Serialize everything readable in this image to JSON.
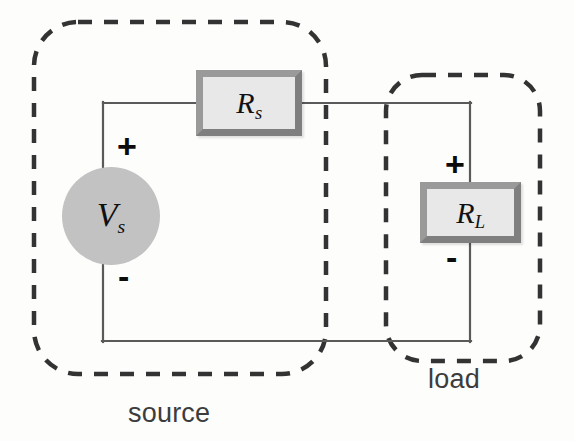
{
  "diagram": {
    "background_color": "#fdfdfc"
  },
  "regions": [
    {
      "id": "source",
      "label": "source",
      "label_x": 128,
      "label_y": 398,
      "boundary_style": "dashed-rounded-rect",
      "x": 34,
      "y": 22,
      "width": 292,
      "height": 352
    },
    {
      "id": "load",
      "label": "load",
      "label_x": 428,
      "label_y": 364,
      "boundary_style": "dashed-rounded-rect",
      "x": 386,
      "y": 75,
      "width": 154,
      "height": 286
    }
  ],
  "components": {
    "source": {
      "name": "voltage-source",
      "symbol": "V",
      "subscript": "s",
      "shape": "filled-circle",
      "fill_color": "#c2c2c2",
      "cx": 111,
      "cy": 216,
      "r": 49,
      "plus_label": "+",
      "minus_label": "-"
    },
    "rs": {
      "name": "series-resistor",
      "symbol": "R",
      "subscript": "s",
      "shape": "rectangle",
      "fill_color": "#e8e8e8",
      "border_color": "#8a8a8a",
      "orientation": "horizontal",
      "x": 196,
      "y": 70,
      "width": 106,
      "height": 66
    },
    "rl": {
      "name": "load-resistor",
      "symbol": "R",
      "subscript": "L",
      "shape": "rectangle",
      "fill_color": "#e8e8e8",
      "border_color": "#8a8a8a",
      "orientation": "vertical",
      "x": 420,
      "y": 182,
      "width": 101,
      "height": 61,
      "plus_label": "+",
      "minus_label": "-"
    }
  },
  "wires": {
    "color": "#5a5a5a",
    "width": 2,
    "segments": [
      {
        "name": "top-left-wire",
        "x1": 103,
        "y1": 103,
        "x2": 196,
        "y2": 103
      },
      {
        "name": "top-right-wire",
        "x1": 302,
        "y1": 103,
        "x2": 470,
        "y2": 103
      },
      {
        "name": "source-top-lead",
        "x1": 103,
        "y1": 103,
        "x2": 103,
        "y2": 167
      },
      {
        "name": "source-bottom-lead",
        "x1": 103,
        "y1": 265,
        "x2": 103,
        "y2": 341
      },
      {
        "name": "bottom-wire",
        "x1": 103,
        "y1": 341,
        "x2": 470,
        "y2": 341
      },
      {
        "name": "rl-top-lead",
        "x1": 470,
        "y1": 103,
        "x2": 470,
        "y2": 182
      },
      {
        "name": "rl-bottom-lead",
        "x1": 470,
        "y1": 243,
        "x2": 470,
        "y2": 341
      }
    ]
  },
  "polarity_marks": [
    {
      "name": "source-plus",
      "label": "+",
      "x": 117,
      "y": 129
    },
    {
      "name": "source-minus",
      "label": "-",
      "x": 118,
      "y": 259
    },
    {
      "name": "load-plus",
      "label": "+",
      "x": 445,
      "y": 147
    },
    {
      "name": "load-minus",
      "label": "-",
      "x": 446,
      "y": 240
    }
  ]
}
